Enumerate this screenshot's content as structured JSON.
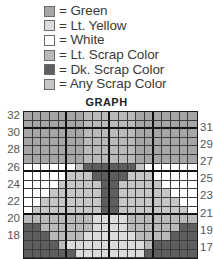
{
  "legend": [
    {
      "code": "G",
      "label": "= Green",
      "color": "#a6a6a6"
    },
    {
      "code": "Y",
      "label": "= Lt. Yellow",
      "color": "#dcdcdc"
    },
    {
      "code": "W",
      "label": "= White",
      "color": "#ffffff"
    },
    {
      "code": "L",
      "label": "= Lt. Scrap Color",
      "color": "#bababa"
    },
    {
      "code": "D",
      "label": "= Dk. Scrap Color",
      "color": "#5e5e5e"
    },
    {
      "code": "A",
      "label": "= Any Scrap Color",
      "color": "#c6c6c6"
    }
  ],
  "graph": {
    "title": "GRAPH",
    "columns": 20,
    "rows": [
      {
        "num": 32,
        "cells": "GGGGGGGLLLLLLGGGGGGG"
      },
      {
        "num": 31,
        "cells": "GGGGGGGLLLLLLGGGGGGG"
      },
      {
        "num": 30,
        "cells": "GGGGGGGLLLLLLGGGGGGG"
      },
      {
        "num": 29,
        "cells": "GGGGGGGLLLLLLGGGGGGG"
      },
      {
        "num": 28,
        "cells": "GGGGGGGLLLLLLGGGGGGG"
      },
      {
        "num": 27,
        "cells": "GGGGGGGLLLLLLGGGGGGG"
      },
      {
        "num": 26,
        "cells": "WWWWWWADDDDDDAWWWWWW"
      },
      {
        "num": 25,
        "cells": "WWWWWAAADDDDAAAWWWWW"
      },
      {
        "num": 24,
        "cells": "WWWWAAAAADDAAAAAWWWW"
      },
      {
        "num": 23,
        "cells": "WWWAAAAAADDAAAAAAWWW"
      },
      {
        "num": 22,
        "cells": "WWAAAAAAADDAAAAAAAWW"
      },
      {
        "num": 21,
        "cells": "WAAAAAAAADDAAAAAAAAW"
      },
      {
        "num": 20,
        "cells": "LLLLLLLLYYYYLLLLLLLL"
      },
      {
        "num": 19,
        "cells": "DDLLLLLLYYYYLLLLLLDD"
      },
      {
        "num": 18,
        "cells": "DDDLLLLYYYYYYLLLLDDD"
      },
      {
        "num": 17,
        "cells": "DDDDLYYYYYYYYYLDDDDD"
      },
      {
        "num": 16,
        "cells": "DDDDDDYYYYYYYYDDDDDD"
      }
    ],
    "left_labels": [
      "32",
      "30",
      "28",
      "26",
      "24",
      "22",
      "20",
      "18"
    ],
    "right_labels": [
      "31",
      "29",
      "27",
      "25",
      "23",
      "21",
      "19",
      "17"
    ]
  }
}
